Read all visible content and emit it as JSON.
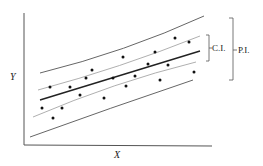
{
  "chart_data": {
    "type": "scatter",
    "title": "",
    "xlabel": "X",
    "ylabel": "Y",
    "grid": false,
    "annotations": [
      "C.I.",
      "P.I."
    ],
    "legend": [],
    "points": [
      [
        42,
        108
      ],
      [
        50,
        87
      ],
      [
        53,
        118
      ],
      [
        62,
        108
      ],
      [
        70,
        87
      ],
      [
        80,
        95
      ],
      [
        86,
        78
      ],
      [
        92,
        70
      ],
      [
        104,
        98
      ],
      [
        113,
        78
      ],
      [
        123,
        57
      ],
      [
        126,
        86
      ],
      [
        135,
        76
      ],
      [
        148,
        64
      ],
      [
        155,
        52
      ],
      [
        160,
        80
      ],
      [
        168,
        65
      ],
      [
        175,
        38
      ],
      [
        189,
        42
      ],
      [
        194,
        72
      ]
    ],
    "series": [
      {
        "name": "regression line",
        "path": "M40,100 L200,51"
      },
      {
        "name": "confidence interval upper",
        "path": "M38,90 Q120,68 200,36"
      },
      {
        "name": "confidence interval lower",
        "path": "M33,117 Q115,82 196,62"
      },
      {
        "name": "prediction interval upper",
        "path": "M40,73 Q125,52 204,16"
      },
      {
        "name": "prediction interval lower",
        "path": "M30,137 Q110,108 193,80"
      }
    ]
  },
  "labels": {
    "x_axis": "X",
    "y_axis": "Y",
    "ci": "C.I.",
    "pi": "P.I."
  },
  "colors": {
    "axis": "#555555",
    "regression": "#222222",
    "ci": "#9a9a9a",
    "pi": "#666666",
    "points": "#111111"
  }
}
